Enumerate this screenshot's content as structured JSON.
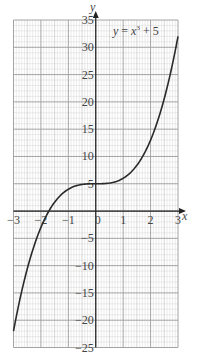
{
  "chart_data": {
    "type": "line",
    "title": "",
    "equation_label": "y = x³ + 5",
    "equation_parts": {
      "lhs": "y",
      "eq": " = ",
      "base": "x",
      "exp": "3",
      "rest": " + 5"
    },
    "xlabel": "x",
    "ylabel": "y",
    "xlim": [
      -3,
      3
    ],
    "ylim": [
      -25,
      35
    ],
    "x_ticks": [
      -3,
      -2,
      -1,
      0,
      1,
      2,
      3
    ],
    "x_tick_labels": [
      "−3",
      "−2",
      "−1",
      "0",
      "1",
      "2",
      "3"
    ],
    "y_ticks": [
      35,
      30,
      25,
      20,
      15,
      10,
      5,
      -5,
      -10,
      -15,
      -20,
      -25
    ],
    "y_tick_labels": [
      "35",
      "30",
      "25",
      "20",
      "15",
      "10",
      "5",
      "−5",
      "−10",
      "−15",
      "−20",
      "−25"
    ],
    "grid": true,
    "series": [
      {
        "name": "y = x^3 + 5",
        "x": [
          -3,
          -2.5,
          -2,
          -1.71,
          -1.5,
          -1,
          -0.5,
          0,
          0.5,
          1,
          1.5,
          2,
          2.5,
          3
        ],
        "values": [
          -22,
          -10.6,
          -3,
          0,
          1.6,
          4,
          4.9,
          5,
          5.1,
          6,
          8.4,
          13,
          20.6,
          32
        ]
      }
    ]
  }
}
